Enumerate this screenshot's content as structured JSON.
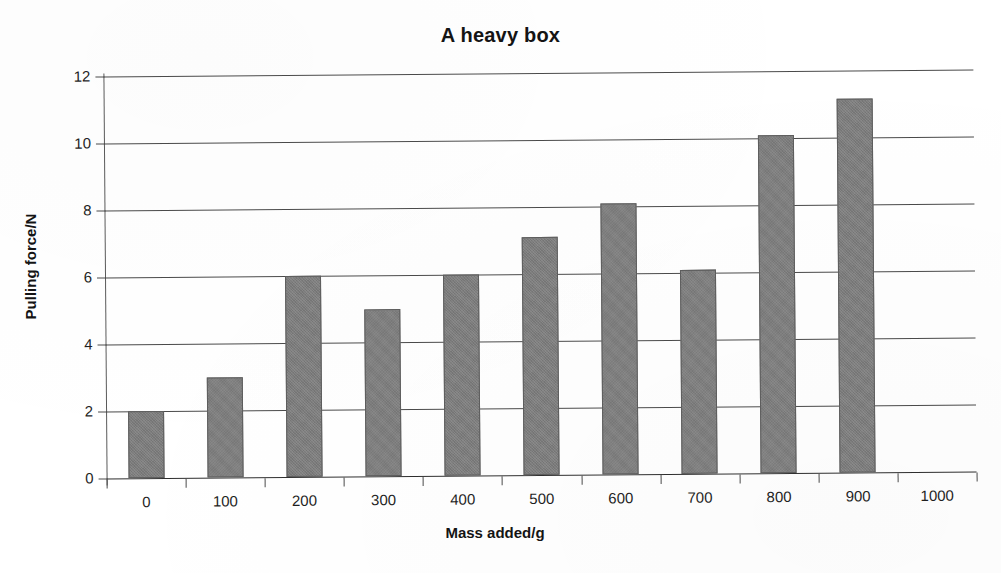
{
  "chart_data": {
    "type": "bar",
    "title": "A heavy box",
    "xlabel": "Mass added/g",
    "ylabel": "Pulling force/N",
    "categories": [
      "0",
      "100",
      "200",
      "300",
      "400",
      "500",
      "600",
      "700",
      "800",
      "900",
      "1000"
    ],
    "values": [
      2.0,
      3.0,
      6.0,
      5.0,
      6.0,
      7.1,
      8.1,
      6.1,
      10.1,
      11.15,
      null
    ],
    "ylim": [
      0,
      12
    ],
    "y_ticks": [
      "0",
      "2",
      "4",
      "6",
      "8",
      "10",
      "12"
    ],
    "y_tick_values": [
      0,
      2,
      4,
      6,
      8,
      10,
      12
    ],
    "grid": true,
    "legend": false,
    "legend_position": "none",
    "bar_color": "#7c7c7c",
    "bar_edge_color": "#5d5d5d",
    "gridline_color": "#4a4a4a",
    "axis_color": "#5a5a5a",
    "text_color": "#1a1a1a",
    "background_color": "#ffffff"
  }
}
